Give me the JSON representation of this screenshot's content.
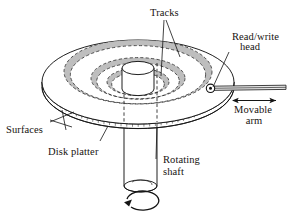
{
  "figure": {
    "type": "technical-illustration",
    "background_color": "#ffffff",
    "line_color": "#141414",
    "track_fill_color": "#b9b9b9"
  },
  "labels": {
    "tracks": "Tracks",
    "read_write_line1": "Read/write",
    "read_write_line2": "head",
    "movable_line1": "Movable",
    "movable_line2": "arm",
    "surfaces": "Surfaces",
    "disk_platter": "Disk platter",
    "rotating_line1": "Rotating",
    "rotating_line2": "shaft"
  },
  "parts": [
    {
      "name": "platter",
      "label": "Disk platter"
    },
    {
      "name": "surfaces",
      "label": "Surfaces"
    },
    {
      "name": "tracks",
      "label": "Tracks"
    },
    {
      "name": "read-write-head",
      "label": "Read/write head"
    },
    {
      "name": "movable-arm",
      "label": "Movable arm"
    },
    {
      "name": "rotating-shaft",
      "label": "Rotating shaft"
    }
  ],
  "icons": {
    "rotation_arrow": "circular-rotation-arrow",
    "movable_arrow": "double-headed-horizontal-arrow"
  }
}
